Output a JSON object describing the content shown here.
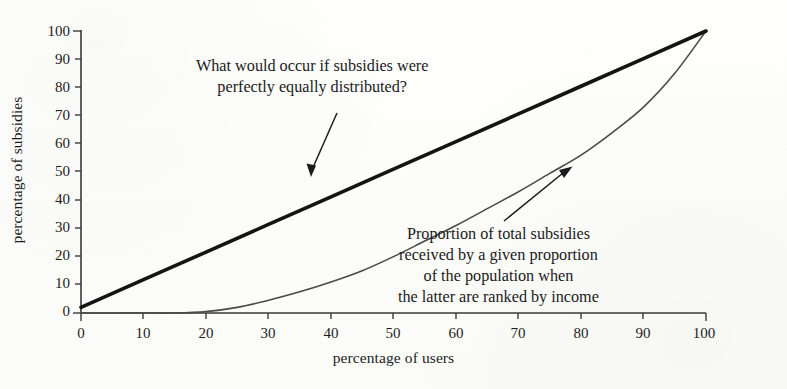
{
  "chart_data": {
    "type": "line",
    "title": "",
    "xlabel": "percentage of users",
    "ylabel": "percentage of subsidies",
    "xlim": [
      0,
      100
    ],
    "ylim": [
      0,
      100
    ],
    "xticks": [
      "0",
      "10",
      "20",
      "30",
      "40",
      "50",
      "60",
      "70",
      "80",
      "90",
      "100"
    ],
    "yticks": [
      "0",
      "10",
      "20",
      "30",
      "40",
      "50",
      "60",
      "70",
      "80",
      "90",
      "100"
    ],
    "grid": false,
    "legend_position": "none",
    "series": [
      {
        "name": "line-of-perfect-equality",
        "style": "thick-solid-black",
        "color": "#141414",
        "x": [
          0,
          10,
          20,
          30,
          40,
          50,
          60,
          70,
          80,
          90,
          100
        ],
        "values": [
          2,
          11.8,
          21.6,
          31.4,
          41.2,
          51,
          60.8,
          70.6,
          80.4,
          90.2,
          100
        ]
      },
      {
        "name": "lorenz-curve-subsidies",
        "style": "thin-solid-grey",
        "color": "#4a4a4a",
        "x": [
          0,
          5,
          10,
          15,
          20,
          25,
          30,
          35,
          40,
          45,
          50,
          55,
          60,
          65,
          70,
          75,
          80,
          85,
          90,
          95,
          100
        ],
        "values": [
          0,
          0,
          0,
          0,
          0.5,
          2,
          4.5,
          7.5,
          11,
          15,
          20,
          25.5,
          31,
          37,
          43,
          49.5,
          56,
          64,
          73,
          85,
          100
        ]
      }
    ],
    "annotations": [
      {
        "name": "equality-annotation",
        "lines": [
          "What would occur if subsidies were",
          "perfectly equally distributed?"
        ],
        "arrow_from": [
          40,
          72
        ],
        "arrow_to": [
          47,
          50
        ]
      },
      {
        "name": "lorenz-annotation",
        "lines": [
          "Proportion of total subsidies",
          "received by a given proportion",
          "of the population when",
          "the latter are ranked by income"
        ],
        "arrow_from": [
          86,
          42
        ],
        "arrow_to": [
          79,
          53
        ]
      }
    ]
  },
  "axes": {
    "x_title": "percentage of users",
    "y_title": "percentage of subsidies"
  },
  "colors": {
    "background": "#fdfdfb",
    "axis": "#3a3a3a",
    "equality_line": "#141414",
    "lorenz_line": "#4a4a4a",
    "text": "#1b1b1b"
  }
}
